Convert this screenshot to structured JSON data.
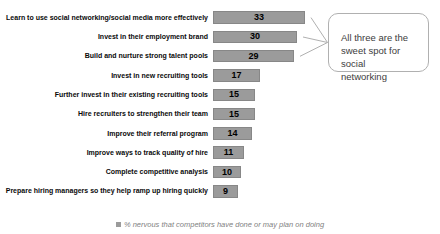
{
  "chart_data": {
    "type": "bar",
    "orientation": "horizontal",
    "categories": [
      "Learn to use social networking/social media more effectively",
      "Invest in their employment brand",
      "Build and nurture strong talent pools",
      "Invest in new recruiting tools",
      "Further invest in their existing recruiting tools",
      "Hire recruiters to strengthen their team",
      "Improve their referral program",
      "Improve ways to track quality of hire",
      "Complete competitive analysis",
      "Prepare hiring managers so they help ramp up hiring quickly"
    ],
    "values": [
      33,
      30,
      29,
      17,
      15,
      15,
      14,
      11,
      10,
      9
    ],
    "xlim": [
      0,
      33
    ],
    "grid": false,
    "data_labels": "inside-center",
    "legend_position": "bottom-center",
    "legend_label": "% nervous that competitors have done or may plan on doing",
    "annotation": "All three are the sweet spot for social networking",
    "annotation_targets_indices": [
      0,
      1,
      2
    ]
  },
  "callout": {
    "text": "All three are the\nsweet spot for\nsocial\nnetworking"
  },
  "legend": {
    "label": "% nervous that competitors have done or may plan on doing"
  },
  "colors": {
    "bar_fill": "#9b9b9b",
    "bar_border": "#878787",
    "value_text": "#000000",
    "category_text": "#0a0a0a",
    "callout_border": "#b0b0b0",
    "callout_text": "#3d3d3d",
    "connector_line": "#b0b0b0",
    "legend_text": "#7f7f7f",
    "background": "#ffffff"
  }
}
